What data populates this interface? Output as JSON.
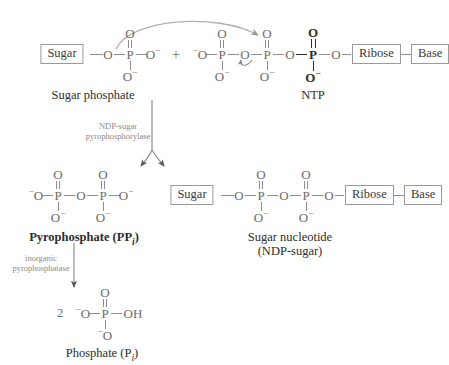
{
  "diagram": {
    "title_hidden": "Formation of a sugar nucleotide (NDP-sugar)",
    "glyphs": {
      "O": "O",
      "P": "P",
      "OH": "OH",
      "minus": "−",
      "plus": "+",
      "two": "2"
    },
    "top_row": {
      "sugar_box": "Sugar",
      "ribose_box": "Ribose",
      "base_box": "Base",
      "plus": "+",
      "caption_left": "Sugar phosphate",
      "caption_right": "NTP",
      "sugar_phosphate": {
        "bridge_o": "O",
        "p": "P",
        "o_top": "O",
        "o_bottom": "O",
        "o_bottom_charge": "−",
        "o_right": "O",
        "o_right_charge": "−"
      },
      "ntp": {
        "o_gamma_left": "O",
        "o_gamma_left_charge": "−",
        "p_gamma": "P",
        "o_gamma_top": "O",
        "o_gamma_bottom": "O",
        "o_gamma_bottom_charge": "−",
        "o_bridge_1": "O",
        "p_beta": "P",
        "o_beta_top": "O",
        "o_beta_bottom": "O",
        "o_beta_bottom_charge": "−",
        "o_bridge_2": "O",
        "p_alpha": "P",
        "o_alpha_top": "O",
        "o_alpha_bottom": "O",
        "o_alpha_bottom_charge": "−",
        "o_to_ribose": "O"
      }
    },
    "enzyme_1": {
      "line1": "NDP-sugar",
      "line2": "pyrophosphorylase"
    },
    "pyrophosphate": {
      "o_left": "O",
      "o_left_charge": "−",
      "p1": "P",
      "o1_top": "O",
      "o1_bottom": "O",
      "o1_bottom_charge": "−",
      "o_bridge": "O",
      "p2": "P",
      "o2_top": "O",
      "o2_bottom": "O",
      "o2_bottom_charge": "−",
      "o_right": "O",
      "o_right_charge": "−",
      "caption": "Pyrophosphate (PP",
      "caption_sub": "i",
      "caption_end": ")"
    },
    "sugar_nucleotide": {
      "sugar_box": "Sugar",
      "ribose_box": "Ribose",
      "base_box": "Base",
      "o_1": "O",
      "p1": "P",
      "p1_o_top": "O",
      "p1_o_bottom": "O",
      "p1_o_bottom_charge": "−",
      "o_bridge": "O",
      "p2": "P",
      "p2_o_top": "O",
      "p2_o_bottom": "O",
      "p2_o_bottom_charge": "−",
      "o_2": "O",
      "caption_line1": "Sugar nucleotide",
      "caption_line2": "(NDP-sugar)"
    },
    "enzyme_2": {
      "line1": "inorganic",
      "line2": "pyrophosphatase"
    },
    "phosphate": {
      "coefficient": "2",
      "o_left": "O",
      "o_left_charge": "−",
      "p": "P",
      "o_top": "O",
      "o_bottom": "O",
      "o_bottom_charge": "−",
      "oh_right": "OH",
      "caption": "Phosphate (P",
      "caption_sub": "i",
      "caption_end": ")"
    },
    "colors": {
      "ink": "#6b6b6b",
      "ink_dark": "#2f2f2f",
      "caption": "#2d2d2d",
      "enzyme": "#8a8a8a",
      "box_border": "#9a9a9a",
      "arrow": "#9a9a9a",
      "background": "#ffffff"
    }
  }
}
